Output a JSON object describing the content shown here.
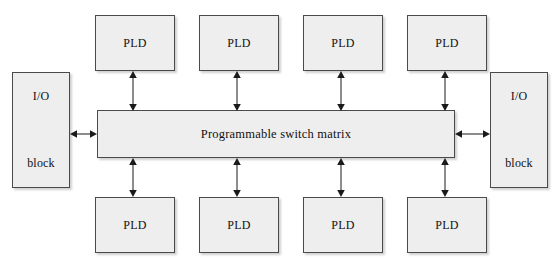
{
  "diagram": {
    "background_color": "#ffffff",
    "block_fill_color": "#eeeeee",
    "block_border_color": "#4a4a4a",
    "arrow_color": "#1a1a1a",
    "center_block": {
      "label": "Programmable switch matrix"
    },
    "io_blocks": [
      {
        "line1": "I/O",
        "line2": "block",
        "side": "left"
      },
      {
        "line1": "I/O",
        "line2": "block",
        "side": "right"
      }
    ],
    "pld_top": [
      {
        "label": "PLD"
      },
      {
        "label": "PLD"
      },
      {
        "label": "PLD"
      },
      {
        "label": "PLD"
      }
    ],
    "pld_bottom": [
      {
        "label": "PLD"
      },
      {
        "label": "PLD"
      },
      {
        "label": "PLD"
      },
      {
        "label": "PLD"
      }
    ],
    "connections": {
      "vertical_top_count": 4,
      "vertical_bottom_count": 4,
      "horizontal_count": 2,
      "style": "double-headed"
    }
  }
}
